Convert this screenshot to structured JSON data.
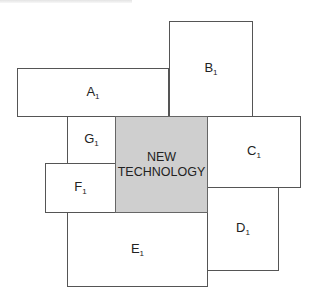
{
  "diagram": {
    "center": {
      "line1": "NEW",
      "line2": "TECHNOLOGY",
      "fill": "#cfcfcf"
    },
    "boxes": [
      {
        "id": "A",
        "letter": "A",
        "subscript": "1"
      },
      {
        "id": "B",
        "letter": "B",
        "subscript": "1"
      },
      {
        "id": "C",
        "letter": "C",
        "subscript": "1"
      },
      {
        "id": "D",
        "letter": "D",
        "subscript": "1"
      },
      {
        "id": "E",
        "letter": "E",
        "subscript": "1"
      },
      {
        "id": "F",
        "letter": "F",
        "subscript": "1"
      },
      {
        "id": "G",
        "letter": "G",
        "subscript": "1"
      }
    ],
    "border_color": "#555555"
  }
}
